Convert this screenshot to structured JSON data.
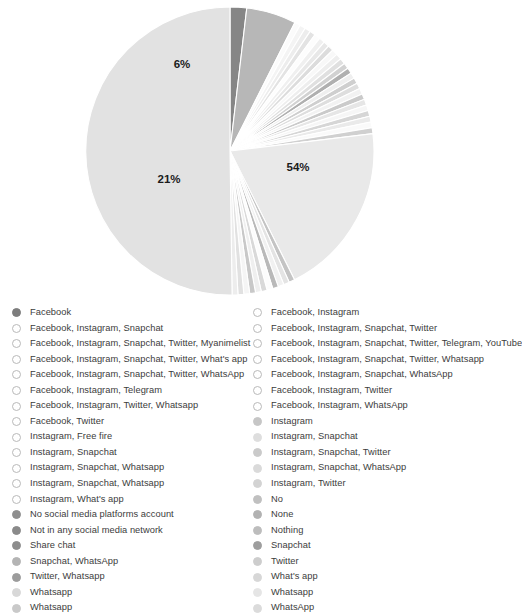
{
  "chart_data": {
    "type": "pie",
    "title": "",
    "legend_position": "bottom",
    "start_angle_deg": -90,
    "direction": "clockwise",
    "labels": [
      "Facebook",
      "Facebook, Instagram",
      "Facebook, Instagram, Snapchat",
      "Facebook, Instagram, Snapchat, Twitter",
      "Facebook, Instagram, Snapchat, Twitter, Myanimelist",
      "Facebook, Instagram, Snapchat, Twitter, Telegram, YouTube",
      "Facebook, Instagram, Snapchat, Twitter, What's app",
      "Facebook, Instagram, Snapchat, Twitter, Whatsapp",
      "Facebook, Instagram, Snapchat, Twitter, WhatsApp",
      "Facebook, Instagram, Snapchat, WhatsApp",
      "Facebook, Instagram, Telegram",
      "Facebook, Instagram, Twitter",
      "Facebook, Instagram, Twitter, Whatsapp",
      "Facebook, Instagram, WhatsApp",
      "Facebook, Twitter",
      "Instagram",
      "Instagram, Free fire",
      "Instagram, Snapchat",
      "Instagram, Snapchat",
      "Instagram, Snapchat, Twitter",
      "Instagram, Snapchat, Whatsapp",
      "Instagram, Snapchat, WhatsApp",
      "Instagram, Snapchat, Whatsapp",
      "Instagram, Twitter",
      "Instagram, What's app",
      "No",
      "No social media platforms account",
      "None",
      "Not in any social media network",
      "Nothing",
      "Share chat",
      "Snapchat",
      "Snapchat, WhatsApp",
      "Twitter",
      "Twitter, Whatsapp",
      "What's app",
      "Whatsapp",
      "Whatsapp",
      "WhatsApp"
    ],
    "values": [
      2.0,
      6.0,
      0.7,
      0.7,
      0.7,
      0.7,
      0.7,
      0.7,
      0.7,
      0.7,
      0.7,
      0.7,
      0.7,
      0.7,
      0.7,
      0.7,
      0.7,
      0.7,
      0.7,
      0.7,
      0.7,
      0.7,
      0.7,
      0.7,
      0.7,
      0.7,
      21.0,
      0.7,
      0.7,
      0.7,
      0.7,
      0.7,
      0.7,
      0.7,
      0.7,
      0.7,
      0.7,
      0.7,
      54.0
    ],
    "colors": [
      "#868686",
      "#b7b7b7",
      "#fbfbfb",
      "#f4f4f4",
      "#ededed",
      "#e3e3e3",
      "#fdfdfd",
      "#f0f0f0",
      "#e8e8e8",
      "#dcdcdc",
      "#f8f8f8",
      "#eeeeee",
      "#e0e0e0",
      "#d2d2d2",
      "#b0b0b0",
      "#efefef",
      "#cfcfcf",
      "#dedede",
      "#f2f2f2",
      "#cacaca",
      "#e6e6e6",
      "#f6f6f6",
      "#d6d6d6",
      "#eaeaea",
      "#fafafa",
      "#d0d0d0",
      "#e9e9e9",
      "#c4c4c4",
      "#e4e4e4",
      "#f1f1f1",
      "#b9b9b9",
      "#fcfcfc",
      "#d9d9d9",
      "#efefef",
      "#c8c8c8",
      "#f5f5f5",
      "#e1e1e1",
      "#ededed",
      "#e2e2e2"
    ],
    "visible_percent_labels": [
      {
        "text": "54%",
        "x": 298,
        "y": 168
      },
      {
        "text": "21%",
        "x": 169,
        "y": 180
      },
      {
        "text": "6%",
        "x": 182,
        "y": 65
      }
    ]
  },
  "legend": {
    "left_column": [
      {
        "label": "Facebook",
        "marker": "#7d7d7d",
        "filled": true
      },
      {
        "label": "Facebook, Instagram, Snapchat",
        "marker": "#fbfbfb",
        "filled": false
      },
      {
        "label": "Facebook, Instagram, Snapchat, Twitter, Myanimelist",
        "marker": "#ededed",
        "filled": false
      },
      {
        "label": "Facebook, Instagram, Snapchat, Twitter, What's app",
        "marker": "#fdfdfd",
        "filled": false
      },
      {
        "label": "Facebook, Instagram, Snapchat, Twitter, WhatsApp",
        "marker": "#e8e8e8",
        "filled": false
      },
      {
        "label": "Facebook, Instagram, Telegram",
        "marker": "#f8f8f8",
        "filled": false
      },
      {
        "label": "Facebook, Instagram, Twitter, Whatsapp",
        "marker": "#e0e0e0",
        "filled": false
      },
      {
        "label": "Facebook, Twitter",
        "marker": "#b0b0b0",
        "filled": false
      },
      {
        "label": "Instagram, Free fire",
        "marker": "#cfcfcf",
        "filled": false
      },
      {
        "label": "Instagram, Snapchat",
        "marker": "#f2f2f2",
        "filled": false
      },
      {
        "label": "Instagram, Snapchat, Whatsapp",
        "marker": "#e6e6e6",
        "filled": false
      },
      {
        "label": "Instagram, Snapchat, Whatsapp",
        "marker": "#d6d6d6",
        "filled": false
      },
      {
        "label": "Instagram, What's app",
        "marker": "#fafafa",
        "filled": false
      },
      {
        "label": "No social media platforms account",
        "marker": "#8f8f8f",
        "filled": true
      },
      {
        "label": "Not in any social media network",
        "marker": "#8a8a8a",
        "filled": true
      },
      {
        "label": "Share chat",
        "marker": "#8d8d8d",
        "filled": true
      },
      {
        "label": "Snapchat, WhatsApp",
        "marker": "#b4b4b4",
        "filled": true
      },
      {
        "label": "Twitter, Whatsapp",
        "marker": "#9c9c9c",
        "filled": true
      },
      {
        "label": "Whatsapp",
        "marker": "#d8d8d8",
        "filled": true
      },
      {
        "label": "Whatsapp",
        "marker": "#c9c9c9",
        "filled": true
      }
    ],
    "right_column": [
      {
        "label": "Facebook, Instagram",
        "marker": "#eeeeee",
        "filled": false
      },
      {
        "label": "Facebook, Instagram, Snapchat, Twitter",
        "marker": "#f4f4f4",
        "filled": false
      },
      {
        "label": "Facebook, Instagram, Snapchat, Twitter, Telegram, YouTube",
        "marker": "#e3e3e3",
        "filled": false
      },
      {
        "label": "Facebook, Instagram, Snapchat, Twitter, Whatsapp",
        "marker": "#f0f0f0",
        "filled": false
      },
      {
        "label": "Facebook, Instagram, Snapchat, WhatsApp",
        "marker": "#dcdcdc",
        "filled": false
      },
      {
        "label": "Facebook, Instagram, Twitter",
        "marker": "#eeeeee",
        "filled": false
      },
      {
        "label": "Facebook, Instagram, WhatsApp",
        "marker": "#d2d2d2",
        "filled": false
      },
      {
        "label": "Instagram",
        "marker": "#c6c6c6",
        "filled": true
      },
      {
        "label": "Instagram, Snapchat",
        "marker": "#dedede",
        "filled": true
      },
      {
        "label": "Instagram, Snapchat, Twitter",
        "marker": "#cacaca",
        "filled": true
      },
      {
        "label": "Instagram, Snapchat, WhatsApp",
        "marker": "#dadada",
        "filled": true
      },
      {
        "label": "Instagram, Twitter",
        "marker": "#d3d3d3",
        "filled": true
      },
      {
        "label": "No",
        "marker": "#c0c0c0",
        "filled": true
      },
      {
        "label": "None",
        "marker": "#b2b2b2",
        "filled": true
      },
      {
        "label": "Nothing",
        "marker": "#bdbdbd",
        "filled": true
      },
      {
        "label": "Snapchat",
        "marker": "#9e9e9e",
        "filled": true
      },
      {
        "label": "Twitter",
        "marker": "#cdcdcd",
        "filled": true
      },
      {
        "label": "What's app",
        "marker": "#d7d7d7",
        "filled": true
      },
      {
        "label": "Whatsapp",
        "marker": "#e5e5e5",
        "filled": true
      },
      {
        "label": "WhatsApp",
        "marker": "#dbdbdb",
        "filled": true
      }
    ]
  }
}
